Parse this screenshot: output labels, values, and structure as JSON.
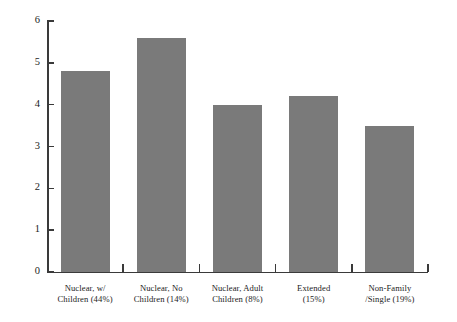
{
  "chart_data": {
    "type": "bar",
    "title": "",
    "subtitle": "",
    "xlabel": "",
    "ylabel": "",
    "ylim": [
      0,
      6
    ],
    "ytick_labels": [
      "0",
      "1",
      "2",
      "3",
      "4",
      "5",
      "6"
    ],
    "ytick_values": [
      0,
      1,
      2,
      3,
      4,
      5,
      6
    ],
    "grid": false,
    "legend": null,
    "bar_color": "#7a7a7a",
    "axis_color": "#3a3a3a",
    "background_color": "#ffffff",
    "categories": [
      "Nuclear, w/ Children (44%)",
      "Nuclear, No Children (14%)",
      "Nuclear, Adult Children (8%)",
      "Extended (15%)",
      "Non-Family /Single (19%)"
    ],
    "category_lines": [
      [
        "Nuclear, w/",
        "Children (44%)"
      ],
      [
        "Nuclear, No",
        "Children (14%)"
      ],
      [
        "Nuclear, Adult",
        "Children (8%)"
      ],
      [
        "Extended",
        "(15%)"
      ],
      [
        "Non-Family",
        "/Single (19%)"
      ]
    ],
    "values": [
      4.8,
      5.6,
      4.0,
      4.2,
      3.5
    ]
  }
}
